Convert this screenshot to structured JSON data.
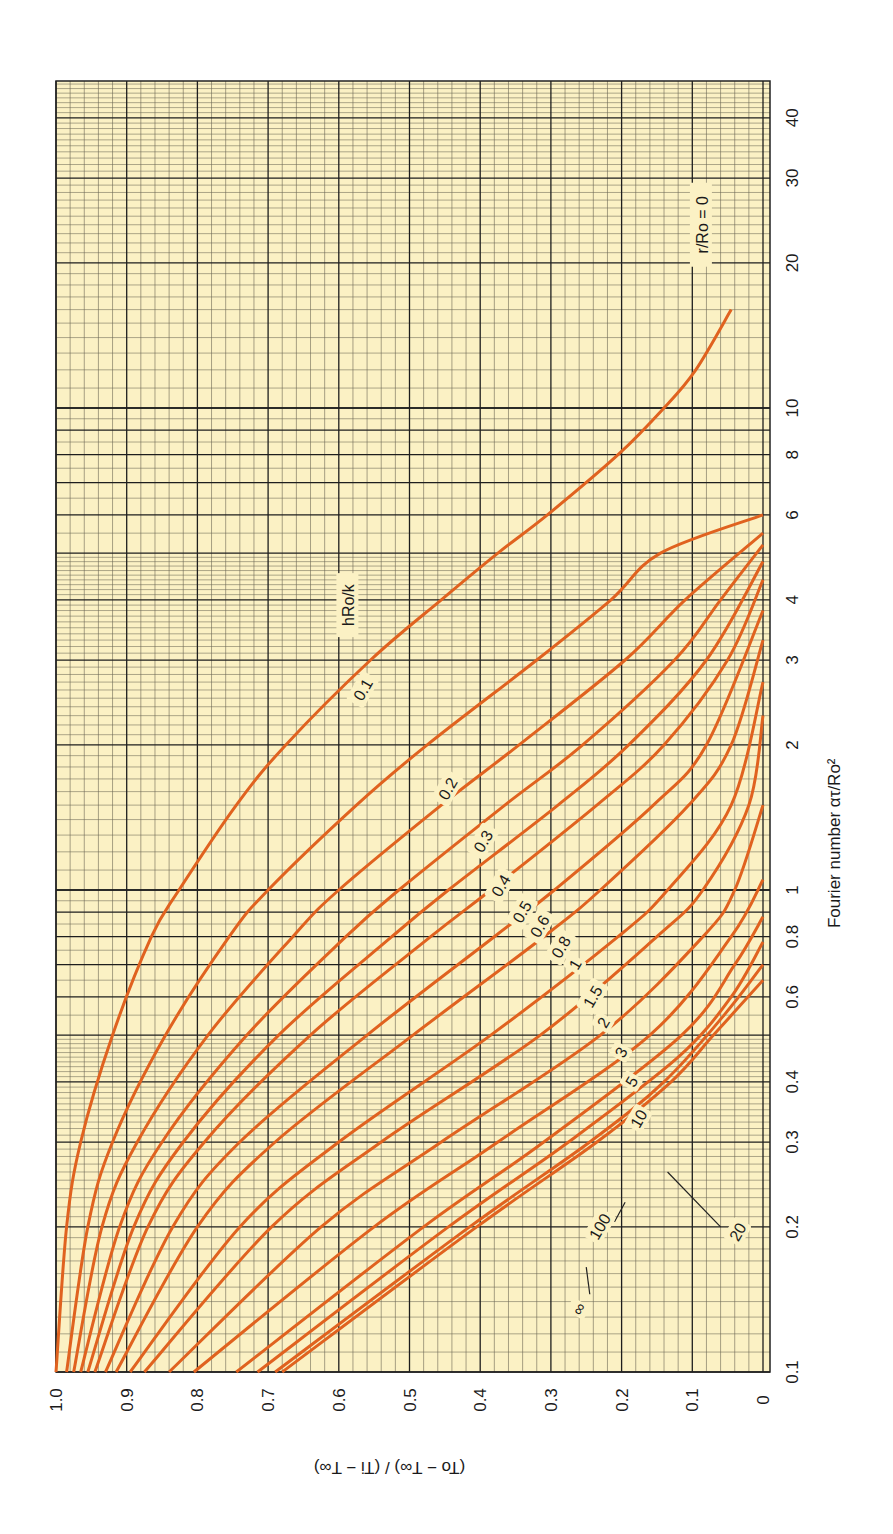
{
  "chart_data": {
    "type": "line",
    "title": "",
    "orientation": "rotated-90-ccw",
    "xlabel": "Fourier number ατ/Ro²",
    "ylabel": "(To − T∞) / (Ti − T∞)",
    "xscale": "log",
    "xlim": [
      0.1,
      48
    ],
    "ylim": [
      0,
      1.0
    ],
    "grid": true,
    "x_ticks": [
      0.1,
      0.2,
      0.3,
      0.4,
      0.6,
      0.8,
      1,
      2,
      3,
      4,
      6,
      8,
      10,
      20,
      30,
      40
    ],
    "x_tick_labels": [
      "0.1",
      "0.2",
      "0.3",
      "0.4",
      "0.6",
      "0.8",
      "1",
      "2",
      "3",
      "4",
      "6",
      "8",
      "10",
      "20",
      "30",
      "40"
    ],
    "y_ticks": [
      0,
      0.1,
      0.2,
      0.3,
      0.4,
      0.5,
      0.6,
      0.7,
      0.8,
      0.9,
      1.0
    ],
    "y_tick_labels": [
      "0",
      "0.1",
      "0.2",
      "0.3",
      "0.4",
      "0.5",
      "0.6",
      "0.7",
      "0.8",
      "0.9",
      "1.0"
    ],
    "annotations": [
      "r/Ro = 0",
      "hRo/k"
    ],
    "legend_title": "hRo/k",
    "series": [
      {
        "name": "0.1",
        "x": [
          0.1,
          0.2,
          0.3,
          0.5,
          0.8,
          1,
          1.5,
          2,
          3,
          4,
          5,
          6,
          8,
          10,
          12,
          16
        ],
        "values": [
          1.0,
          0.985,
          0.965,
          0.92,
          0.865,
          0.826,
          0.745,
          0.675,
          0.555,
          0.455,
          0.375,
          0.305,
          0.205,
          0.14,
          0.095,
          0.045
        ]
      },
      {
        "name": "0.2",
        "x": [
          0.1,
          0.2,
          0.3,
          0.5,
          0.8,
          1,
          1.5,
          2,
          3,
          4,
          5,
          6
        ],
        "values": [
          0.985,
          0.955,
          0.92,
          0.845,
          0.755,
          0.7,
          0.575,
          0.475,
          0.32,
          0.215,
          0.145,
          0.0
        ]
      },
      {
        "name": "0.3",
        "x": [
          0.1,
          0.2,
          0.3,
          0.5,
          0.8,
          1,
          1.5,
          2,
          3,
          4,
          5.5
        ],
        "values": [
          0.975,
          0.935,
          0.885,
          0.785,
          0.665,
          0.6,
          0.455,
          0.345,
          0.195,
          0.11,
          0.0
        ]
      },
      {
        "name": "0.4",
        "x": [
          0.1,
          0.2,
          0.3,
          0.5,
          0.8,
          1,
          1.5,
          2,
          3,
          4,
          5.2
        ],
        "values": [
          0.965,
          0.91,
          0.85,
          0.73,
          0.59,
          0.515,
          0.365,
          0.255,
          0.125,
          0.06,
          0.0
        ]
      },
      {
        "name": "0.5",
        "x": [
          0.1,
          0.2,
          0.3,
          0.5,
          0.8,
          1,
          1.5,
          2,
          3,
          4.8
        ],
        "values": [
          0.955,
          0.89,
          0.82,
          0.685,
          0.525,
          0.445,
          0.29,
          0.19,
          0.08,
          0.0
        ]
      },
      {
        "name": "0.6",
        "x": [
          0.1,
          0.2,
          0.3,
          0.5,
          0.8,
          1,
          1.5,
          2,
          3,
          4.4
        ],
        "values": [
          0.945,
          0.87,
          0.79,
          0.64,
          0.47,
          0.385,
          0.235,
          0.14,
          0.05,
          0.0
        ]
      },
      {
        "name": "0.8",
        "x": [
          0.1,
          0.2,
          0.3,
          0.5,
          0.8,
          1,
          1.5,
          2,
          3.8
        ],
        "values": [
          0.93,
          0.835,
          0.74,
          0.56,
          0.38,
          0.295,
          0.155,
          0.08,
          0.0
        ]
      },
      {
        "name": "1",
        "x": [
          0.1,
          0.2,
          0.3,
          0.5,
          0.8,
          1,
          1.5,
          2,
          3.3
        ],
        "values": [
          0.915,
          0.8,
          0.69,
          0.495,
          0.31,
          0.23,
          0.105,
          0.045,
          0.0
        ]
      },
      {
        "name": "1.5",
        "x": [
          0.1,
          0.2,
          0.3,
          0.5,
          0.8,
          1,
          1.5,
          2.7
        ],
        "values": [
          0.895,
          0.74,
          0.6,
          0.385,
          0.205,
          0.135,
          0.045,
          0.0
        ]
      },
      {
        "name": "2",
        "x": [
          0.1,
          0.2,
          0.3,
          0.5,
          0.8,
          1,
          1.5,
          2.3
        ],
        "values": [
          0.875,
          0.695,
          0.54,
          0.315,
          0.15,
          0.085,
          0.02,
          0.0
        ]
      },
      {
        "name": "3",
        "x": [
          0.1,
          0.2,
          0.3,
          0.5,
          0.8,
          1,
          1.5
        ],
        "values": [
          0.84,
          0.625,
          0.455,
          0.23,
          0.085,
          0.04,
          0.0
        ]
      },
      {
        "name": "5",
        "x": [
          0.1,
          0.2,
          0.3,
          0.5,
          0.8,
          1.05
        ],
        "values": [
          0.805,
          0.55,
          0.375,
          0.16,
          0.045,
          0.0
        ]
      },
      {
        "name": "10",
        "x": [
          0.1,
          0.2,
          0.3,
          0.5,
          0.7,
          0.88
        ],
        "values": [
          0.745,
          0.48,
          0.31,
          0.115,
          0.04,
          0.0
        ]
      },
      {
        "name": "20",
        "x": [
          0.1,
          0.2,
          0.3,
          0.45,
          0.6,
          0.78
        ],
        "values": [
          0.715,
          0.445,
          0.275,
          0.12,
          0.045,
          0.0
        ]
      },
      {
        "name": "100",
        "x": [
          0.1,
          0.2,
          0.3,
          0.4,
          0.55,
          0.7
        ],
        "values": [
          0.69,
          0.415,
          0.245,
          0.14,
          0.055,
          0.0
        ]
      },
      {
        "name": "∞",
        "x": [
          0.1,
          0.2,
          0.3,
          0.4,
          0.5,
          0.65
        ],
        "values": [
          0.68,
          0.405,
          0.235,
          0.13,
          0.07,
          0.0
        ]
      }
    ],
    "curve_label_positions": [
      {
        "label": "0.1",
        "x": 2.6,
        "y": 0.565
      },
      {
        "label": "0.2",
        "x": 1.62,
        "y": 0.445
      },
      {
        "label": "0.3",
        "x": 1.26,
        "y": 0.395
      },
      {
        "label": "0.4",
        "x": 1.02,
        "y": 0.37
      },
      {
        "label": "0.5",
        "x": 0.9,
        "y": 0.34
      },
      {
        "label": "0.6",
        "x": 0.84,
        "y": 0.315
      },
      {
        "label": "0.8",
        "x": 0.76,
        "y": 0.285
      },
      {
        "label": "1",
        "x": 0.7,
        "y": 0.265
      },
      {
        "label": "1.5",
        "x": 0.6,
        "y": 0.24
      },
      {
        "label": "2",
        "x": 0.53,
        "y": 0.225
      },
      {
        "label": "3",
        "x": 0.46,
        "y": 0.2
      },
      {
        "label": "5",
        "x": 0.4,
        "y": 0.185
      },
      {
        "label": "10",
        "x": 0.335,
        "y": 0.175
      },
      {
        "label": "20",
        "x": 0.195,
        "y": 0.035
      },
      {
        "label": "100",
        "x": 0.2,
        "y": 0.23
      },
      {
        "label": "∞",
        "x": 0.135,
        "y": 0.26
      }
    ],
    "line_color": "#e0621f",
    "paper_color": "#fbf1c4",
    "grid_color": "#2a2a2a"
  }
}
